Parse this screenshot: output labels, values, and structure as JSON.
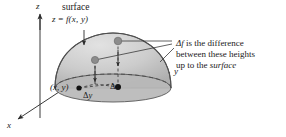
{
  "figure": {
    "name": "partial-derivative-surface-diagram",
    "background_color": "#ffffff",
    "surface_fill": "#c9c9c9",
    "surface_stroke": "#4d4d4d",
    "dot_gray": "#8c8c8c",
    "dot_black": "#111111",
    "axis_color": "#3a3a3a",
    "dash_color": "#555555"
  },
  "axes": {
    "z_label": "z",
    "y_label": "y",
    "x_label": "x"
  },
  "surface_callout": {
    "line1": "surface",
    "line2_prefix": "z",
    "line2_equals": "=",
    "line2_func": "f(x, y)"
  },
  "annotation": {
    "line1_delta": "Δf",
    "line1_rest": " is the difference",
    "line2": "between these heights",
    "line3_prefix": "up to the ",
    "line3_italic": "surface"
  },
  "increments": {
    "dx": "Δx",
    "dy": "Δy"
  },
  "point_label": {
    "text": "(x, y)"
  }
}
